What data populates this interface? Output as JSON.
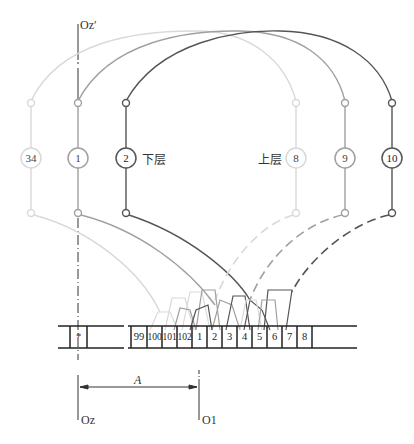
{
  "diagram": {
    "type": "winding-connection-diagram",
    "axis_labels": {
      "top_axis": "Oz′",
      "bottom_left": "Oz",
      "bottom_right": "O1",
      "dimension": "A"
    },
    "layer_labels": {
      "lower": "下层",
      "upper": "上层"
    },
    "coils": [
      {
        "label": "34",
        "x": 31,
        "shade": "light",
        "color": "#d6d6d6"
      },
      {
        "label": "1",
        "x": 78,
        "shade": "medium",
        "color": "#9a9a9a"
      },
      {
        "label": "2",
        "x": 126,
        "shade": "dark",
        "color": "#4a4a4a"
      },
      {
        "label": "8",
        "x": 296,
        "shade": "light",
        "color": "#d6d6d6"
      },
      {
        "label": "9",
        "x": 345,
        "shade": "medium",
        "color": "#9a9a9a"
      },
      {
        "label": "10",
        "x": 392,
        "shade": "dark",
        "color": "#4a4a4a"
      }
    ],
    "slots": {
      "star": "*",
      "numbered": [
        "99",
        "100",
        "101",
        "102",
        "1",
        "2",
        "3",
        "4",
        "5",
        "6",
        "7",
        "8"
      ]
    },
    "colors": {
      "light": "#d6d6d6",
      "medium": "#9a9a9a",
      "dark": "#4a4a4a",
      "axis": "#333333",
      "slot_line": "#222222"
    }
  }
}
